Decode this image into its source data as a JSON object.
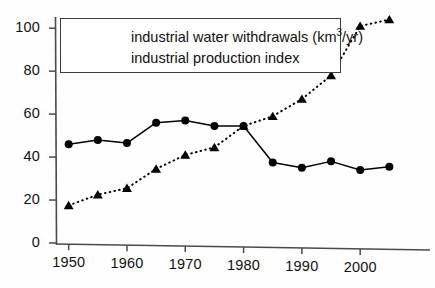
{
  "chart_data": {
    "type": "line",
    "title": "",
    "xlabel": "",
    "ylabel": "",
    "xlim": [
      1948,
      2007
    ],
    "ylim": [
      0,
      108
    ],
    "grid": false,
    "legend_position": "upper-left",
    "x": [
      1950,
      1955,
      1960,
      1965,
      1970,
      1975,
      1980,
      1985,
      1990,
      1995,
      2000,
      2005
    ],
    "xticks": [
      "1950",
      "1960",
      "1970",
      "1980",
      "1990",
      "2000"
    ],
    "xtick_values": [
      1950,
      1960,
      1970,
      1980,
      1990,
      2000
    ],
    "yticks": [
      "0",
      "20",
      "40",
      "60",
      "80",
      "100"
    ],
    "ytick_values": [
      0,
      20,
      40,
      60,
      80,
      100
    ],
    "series": [
      {
        "name": "industrial water withdrawals (km3/yr)",
        "label_main": "industrial water withdrawals (km",
        "label_sup": "3",
        "label_tail": "/yr)",
        "marker": "circle",
        "linestyle": "solid",
        "color": "#000000",
        "values": [
          46,
          48,
          46.5,
          56,
          57,
          54.5,
          54.5,
          37.5,
          35,
          38,
          34,
          35.5
        ]
      },
      {
        "name": "industrial production index",
        "label_main": "industrial production index",
        "label_sup": "",
        "label_tail": "",
        "marker": "triangle",
        "linestyle": "dotted",
        "color": "#000000",
        "values": [
          17.5,
          22.5,
          25.5,
          34.5,
          41,
          44.5,
          54.5,
          59,
          67,
          78,
          101,
          104
        ]
      }
    ]
  }
}
